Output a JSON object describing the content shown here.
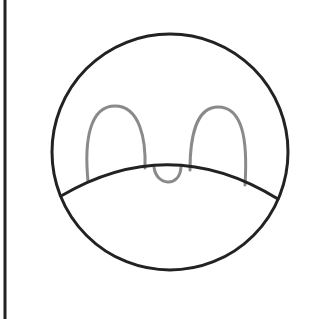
{
  "drawing": {
    "description": "Simple line drawing of a round face with two tall oval eyes above a curved line and a small U-shaped mark",
    "colors": {
      "background": "#ffffff",
      "outline": "#222222",
      "eyes": "#8a8a8a"
    },
    "left_edge_line": {
      "x": 5,
      "y1": 0,
      "y2": 319,
      "width": 3
    },
    "head_circle": {
      "cx": 170,
      "cy": 152,
      "r": 118,
      "stroke_width": 3
    },
    "mouth_arc": {
      "start": [
        61,
        196
      ],
      "control": [
        170,
        132
      ],
      "end": [
        278,
        199
      ],
      "stroke_width": 3
    },
    "left_eye": {
      "path": "M 88 181 C 84 140, 90 106, 115 106 C 140 106, 146 140, 145 168"
    },
    "right_eye": {
      "path": "M 190 170 C 190 138, 196 107, 218 107 C 242 107, 248 138, 245 185"
    },
    "nose": {
      "path": "M 154 167 C 156 186, 180 188, 181 167"
    }
  }
}
